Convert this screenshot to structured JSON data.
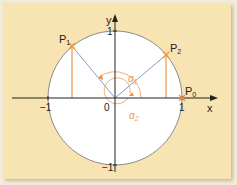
{
  "figure": {
    "colors": {
      "background": "#f8e3b2",
      "circle_fill": "#ffffff",
      "circle_stroke": "#8a8a8a",
      "axis": "#222222",
      "accent": "#f0933a",
      "radius_line": "#8a9bbf"
    },
    "axes": {
      "x_label": "x",
      "y_label": "y",
      "origin_label": "0",
      "tick_x_pos": "1",
      "tick_x_neg": "−1",
      "tick_y_pos": "1",
      "tick_y_neg": "−1"
    },
    "points": [
      {
        "name": "P",
        "sub": "0",
        "x": 1.0,
        "y": 0.0
      },
      {
        "name": "P",
        "sub": "1",
        "x": -0.64,
        "y": 0.77
      },
      {
        "name": "P",
        "sub": "2",
        "x": 0.76,
        "y": 0.64
      }
    ],
    "angles": [
      {
        "name": "α",
        "sub": "1",
        "description": "arc from P0 counterclockwise to P1"
      },
      {
        "name": "α",
        "sub": "2",
        "description": "arc from P0 clockwise (full turn) to P2"
      }
    ]
  }
}
